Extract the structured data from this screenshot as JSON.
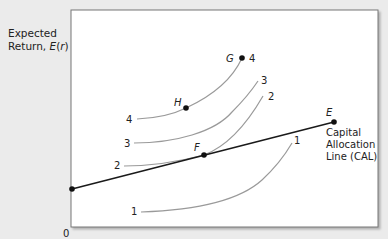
{
  "figure": {
    "y_axis_label": {
      "line1": "Expected",
      "line2_prefix": "Return, ",
      "line2_symbol": "E",
      "line2_paren_open": "(",
      "line2_var": "r",
      "line2_paren_close": ")"
    },
    "origin_label": "0",
    "cal": {
      "label_lines": [
        "Capital",
        "Allocation",
        "Line (CAL)"
      ],
      "color": "#1a1a1a"
    },
    "points": [
      {
        "id": "E",
        "label": "E"
      },
      {
        "id": "F",
        "label": "F"
      },
      {
        "id": "G",
        "label": "G",
        "curve_label": "4"
      },
      {
        "id": "H",
        "label": "H"
      }
    ],
    "indifference_curves": [
      {
        "id": "1",
        "label": "1"
      },
      {
        "id": "2",
        "label": "2"
      },
      {
        "id": "3",
        "label": "3"
      },
      {
        "id": "4",
        "label": "4"
      }
    ],
    "colors": {
      "background": "#ebebeb",
      "plot_area": "#ffffff",
      "curve": "#9a9a9a",
      "frame": "#777777"
    }
  }
}
